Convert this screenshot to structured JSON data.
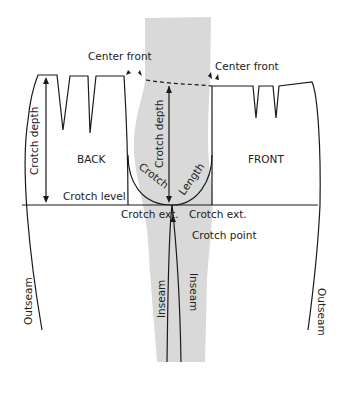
{
  "diagram": {
    "colors": {
      "line": "#1a1a1a",
      "overlay": "#d9d9d9",
      "background": "#ffffff"
    },
    "pieces": {
      "back": "BACK",
      "front": "FRONT"
    },
    "labels": {
      "center_front_left": "Center front",
      "center_front_right": "Center front",
      "crotch_depth_back": "Crotch depth",
      "crotch_depth_center": "Crotch depth",
      "crotch": "Crotch",
      "length": "Length",
      "crotch_level": "Crotch level",
      "crotch_ext_left": "Crotch ext.",
      "crotch_ext_right": "Crotch ext.",
      "crotch_point": "Crotch point",
      "inseam_left": "Inseam",
      "inseam_right": "Inseam",
      "outseam_left": "Outseam",
      "outseam_right": "Outseam"
    }
  }
}
